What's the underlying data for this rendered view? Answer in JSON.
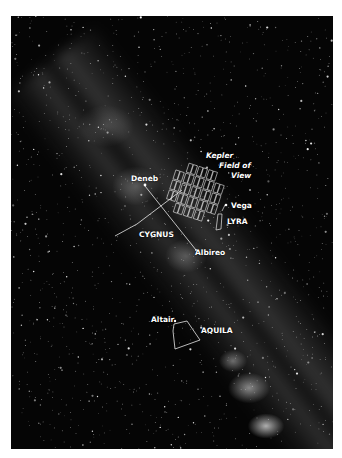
{
  "scene": {
    "description": "Night-sky photograph of the Milky Way with annotated constellations and the Kepler spacecraft field of view",
    "background_color": "#050505",
    "page_color": "#ffffff",
    "annotation_color": "#ffffff"
  },
  "labels": {
    "kepler_line1": "Kepler",
    "kepler_line2": "Field of",
    "kepler_line3": "View",
    "deneb": "Deneb",
    "vega": "Vega",
    "lyra": "LYRA",
    "cygnus": "CYGNUS",
    "albireo": "Albireo",
    "altair": "Altair",
    "aquila": "AQUILA"
  },
  "constellations": [
    {
      "name": "Cygnus",
      "stars": [
        "Deneb",
        "Albireo"
      ]
    },
    {
      "name": "Lyra",
      "stars": [
        "Vega"
      ]
    },
    {
      "name": "Aquila",
      "stars": [
        "Altair"
      ]
    }
  ],
  "kepler_field": {
    "grid_rows": 5,
    "grid_cols": 5,
    "rotation_deg": 18
  }
}
